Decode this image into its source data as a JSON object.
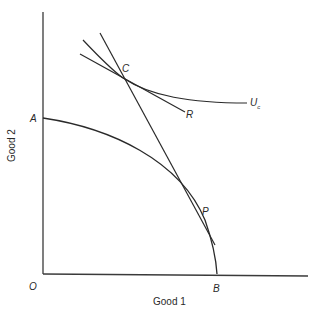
{
  "axes": {
    "x_label": "Good 1",
    "y_label": "Good 2",
    "origin_label": "O"
  },
  "points": {
    "A": "A",
    "B": "B",
    "C": "C",
    "P": "P",
    "R": "R",
    "Uc_main": "U",
    "Uc_sub": "c"
  },
  "colors": {
    "line": "#2a2a2a",
    "background": "#ffffff"
  }
}
